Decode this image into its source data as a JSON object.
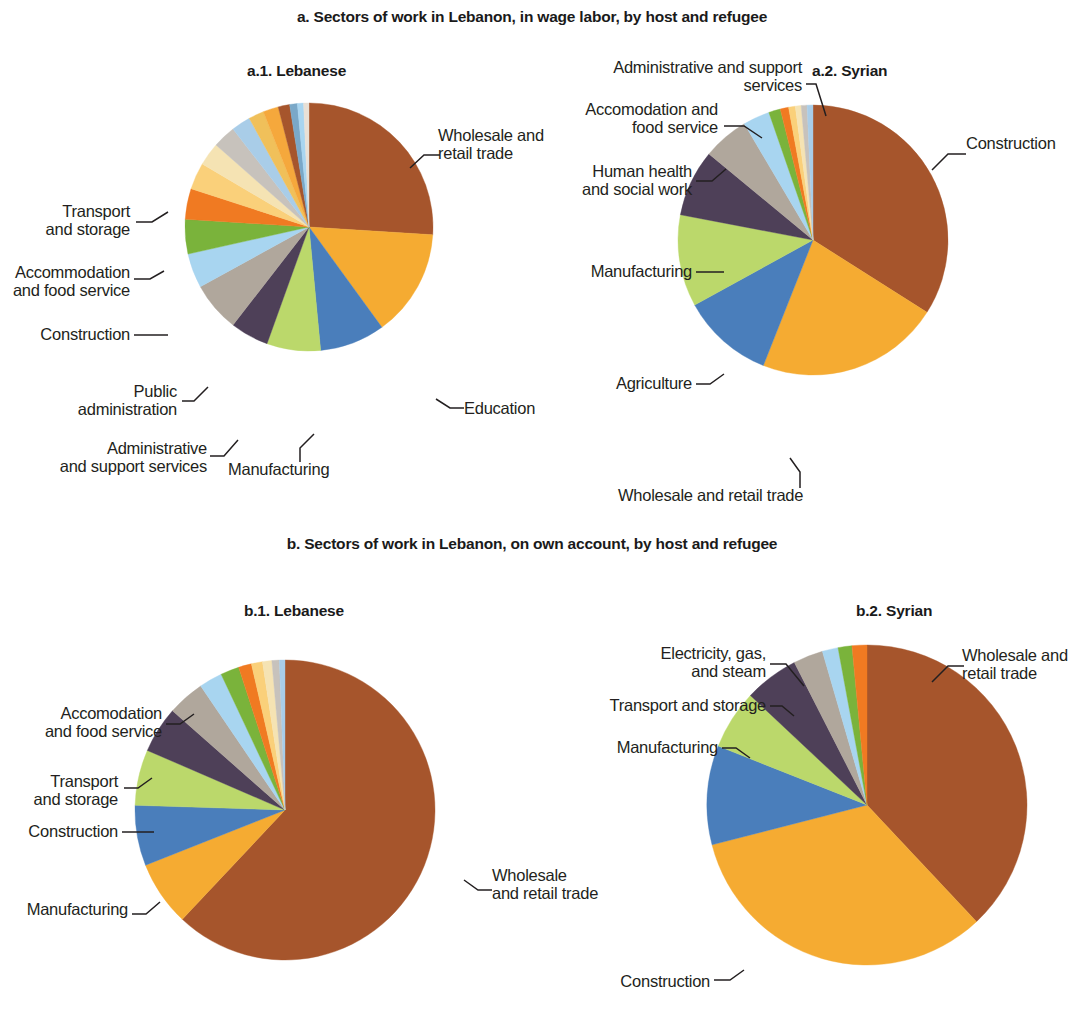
{
  "figure": {
    "panel_a_title": "a. Sectors of work in Lebanon, in wage labor, by host and refugee",
    "panel_b_title": "b. Sectors of work in Lebanon, on own account, by host and refugee",
    "sub_a1": "a.1. Lebanese",
    "sub_a2": "a.2. Syrian",
    "sub_b1": "b.1. Lebanese",
    "sub_b2": "b.2. Syrian"
  },
  "labels": {
    "a1": {
      "wholesale": "Wholesale and\nretail trade",
      "education": "Education",
      "manufacturing": "Manufacturing",
      "admin_support": "Administrative\nand support services",
      "public_admin": "Public\nadministration",
      "construction": "Construction",
      "accommodation": "Accommodation\nand food service",
      "transport": "Transport\nand storage"
    },
    "a2": {
      "construction": "Construction",
      "wholesale": "Wholesale and retail trade",
      "agriculture": "Agriculture",
      "manufacturing": "Manufacturing",
      "human_health": "Human health\nand social work",
      "accommodation": "Accomodation and\nfood service",
      "admin_support": "Administrative and support\nservices"
    },
    "b1": {
      "wholesale": "Wholesale\nand retail trade",
      "manufacturing": "Manufacturing",
      "construction": "Construction",
      "transport": "Transport\nand storage",
      "accommodation": "Accomodation\nand food service"
    },
    "b2": {
      "wholesale": "Wholesale and\nretail trade",
      "construction": "Construction",
      "manufacturing": "Manufacturing",
      "transport": "Transport and storage",
      "electricity": "Electricity, gas,\nand steam"
    }
  },
  "chart_data": [
    {
      "type": "pie",
      "id": "a1",
      "title": "a.1. Lebanese",
      "panel": "a. Sectors of work in Lebanon, in wage labor, by host and refugee",
      "start_angle_deg": 0,
      "direction": "clockwise",
      "unit": "percent",
      "labels": [
        "Wholesale and retail trade",
        "Education",
        "Manufacturing",
        "Administrative and support services",
        "Public administration",
        "Construction",
        "Accommodation and food service",
        "Transport and storage",
        "Other services",
        "Information and communication",
        "Financial and insurance",
        "Professional, scientific and technical",
        "Human health and social work",
        "Arts and entertainment",
        "Agriculture",
        "Real estate",
        "Mining and quarrying",
        "Water supply",
        "Electricity, gas, and steam"
      ],
      "values": [
        26.0,
        14.0,
        8.5,
        7.0,
        5.0,
        6.5,
        4.5,
        4.5,
        4.0,
        3.5,
        3.0,
        3.0,
        2.5,
        2.0,
        2.0,
        1.5,
        1.0,
        0.8,
        0.7
      ],
      "colors": [
        "#a6552c",
        "#f5ab32",
        "#4a7ebb",
        "#bbd86b",
        "#4e4058",
        "#b0a79c",
        "#a8d5f0",
        "#7ab33b",
        "#f07a22",
        "#fad07a",
        "#f5e3b3",
        "#c7c2bc",
        "#a9cde8",
        "#f0c05a",
        "#f5a83c",
        "#a6552c",
        "#7aa8c8",
        "#a8d5f0",
        "#e8e0d6"
      ]
    },
    {
      "type": "pie",
      "id": "a2",
      "title": "a.2. Syrian",
      "panel": "a. Sectors of work in Lebanon, in wage labor, by host and refugee",
      "start_angle_deg": 0,
      "direction": "clockwise",
      "unit": "percent",
      "labels": [
        "Construction",
        "Wholesale and retail trade",
        "Agriculture",
        "Manufacturing",
        "Human health and social work",
        "Accomodation and food service",
        "Administrative and support services",
        "Other services",
        "Transport and storage",
        "Education",
        "Public administration",
        "Information and communication",
        "Water supply"
      ],
      "values": [
        34.0,
        22.0,
        11.0,
        11.0,
        8.0,
        5.5,
        3.2,
        1.4,
        1.0,
        0.8,
        0.7,
        0.7,
        0.7
      ],
      "colors": [
        "#a6552c",
        "#f5ab32",
        "#4a7ebb",
        "#bbd86b",
        "#4e4058",
        "#b0a79c",
        "#a8d5f0",
        "#7ab33b",
        "#f07a22",
        "#fad07a",
        "#f5e3b3",
        "#c7c2bc",
        "#a9cde8"
      ]
    },
    {
      "type": "pie",
      "id": "b1",
      "title": "b.1. Lebanese",
      "panel": "b. Sectors of work in Lebanon, on own account, by host and refugee",
      "start_angle_deg": 0,
      "direction": "clockwise",
      "unit": "percent",
      "labels": [
        "Wholesale and retail trade",
        "Manufacturing",
        "Construction",
        "Transport and storage",
        "Accomodation and food service",
        "Other services",
        "Professional, scientific and technical",
        "Agriculture",
        "Human health and social work",
        "Information and communication",
        "Arts and entertainment",
        "Education",
        "Administrative and support services"
      ],
      "values": [
        62.0,
        7.0,
        6.5,
        6.0,
        5.0,
        4.0,
        2.5,
        2.0,
        1.4,
        1.2,
        1.0,
        0.8,
        0.6
      ],
      "colors": [
        "#a6552c",
        "#f5ab32",
        "#4a7ebb",
        "#bbd86b",
        "#4e4058",
        "#b0a79c",
        "#a8d5f0",
        "#7ab33b",
        "#f07a22",
        "#fad07a",
        "#f5e3b3",
        "#c7c2bc",
        "#a9cde8"
      ]
    },
    {
      "type": "pie",
      "id": "b2",
      "title": "b.2. Syrian",
      "panel": "b. Sectors of work in Lebanon, on own account, by host and refugee",
      "start_angle_deg": 0,
      "direction": "clockwise",
      "unit": "percent",
      "labels": [
        "Wholesale and retail trade",
        "Construction",
        "Manufacturing",
        "Transport and storage",
        "Electricity, gas, and steam",
        "Other services",
        "Accomodation and food service",
        "Agriculture",
        "Human health and social work"
      ],
      "values": [
        38.0,
        33.0,
        10.0,
        6.0,
        5.5,
        3.0,
        1.6,
        1.4,
        1.5
      ],
      "colors": [
        "#a6552c",
        "#f5ab32",
        "#4a7ebb",
        "#bbd86b",
        "#4e4058",
        "#b0a79c",
        "#a8d5f0",
        "#7ab33b",
        "#f07a22"
      ]
    }
  ]
}
